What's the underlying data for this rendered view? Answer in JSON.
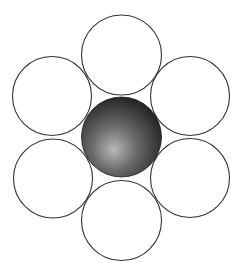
{
  "diagram": {
    "type": "hexagonal-packing",
    "canvas": {
      "width": 245,
      "height": 275
    },
    "stroke_color": "#333333",
    "stroke_width": 1.1,
    "fill_outer": "#ffffff",
    "center_sphere": {
      "cx": 121.5,
      "cy": 137,
      "r": 40,
      "gradient": {
        "highlight": "#b8b8b8",
        "mid": "#6a6a6a",
        "edge": "#262626"
      }
    },
    "outer_circles": [
      {
        "name": "top",
        "cx": 121.5,
        "cy": 55,
        "r": 40
      },
      {
        "name": "upper-right",
        "cx": 190,
        "cy": 96,
        "r": 39.5
      },
      {
        "name": "lower-right",
        "cx": 190,
        "cy": 178,
        "r": 39.5
      },
      {
        "name": "bottom",
        "cx": 121.5,
        "cy": 220.5,
        "r": 40
      },
      {
        "name": "lower-left",
        "cx": 53,
        "cy": 178.5,
        "r": 39.5
      },
      {
        "name": "upper-left",
        "cx": 52,
        "cy": 96,
        "r": 39.5
      }
    ]
  }
}
